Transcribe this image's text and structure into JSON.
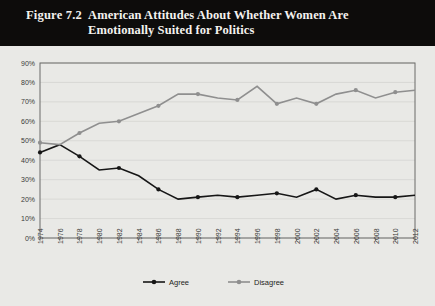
{
  "figure": {
    "number": "Figure 7.2",
    "title": "American Attitudes About Whether Women Are Emotionally Suited for Politics"
  },
  "colors": {
    "banner_background": "#0d0c0b",
    "banner_text": "#f4f2ef",
    "page_background": "#e9e9e6",
    "agree": "#161616",
    "disagree": "#8f8f8f",
    "gridline": "#cfcfcb",
    "axis": "#6b6b68"
  },
  "chart_data": {
    "type": "line",
    "title": "American Attitudes About Whether Women Are Emotionally Suited for Politics",
    "xlabel": "",
    "ylabel": "",
    "xlim": [
      1974,
      2012
    ],
    "ylim": [
      0,
      90
    ],
    "ytick_step": 10,
    "grid": true,
    "legend_position": "bottom",
    "marker_interval_years": 4,
    "x": [
      1974,
      1976,
      1978,
      1980,
      1982,
      1984,
      1986,
      1988,
      1990,
      1992,
      1994,
      1996,
      1998,
      2000,
      2002,
      2004,
      2006,
      2008,
      2010,
      2012
    ],
    "categories": [
      "1974",
      "1976",
      "1978",
      "1980",
      "1982",
      "1984",
      "1986",
      "1988",
      "1990",
      "1992",
      "1994",
      "1996",
      "1998",
      "2000",
      "2002",
      "2004",
      "2006",
      "2008",
      "2010",
      "2012"
    ],
    "ytick_labels": [
      "0%",
      "10%",
      "20%",
      "30%",
      "40%",
      "50%",
      "60%",
      "70%",
      "80%",
      "90%"
    ],
    "ytick_values": [
      0,
      10,
      20,
      30,
      40,
      50,
      60,
      70,
      80,
      90
    ],
    "series": [
      {
        "name": "Agree",
        "color": "#161616",
        "values": [
          44,
          48,
          42,
          35,
          36,
          32,
          25,
          20,
          21,
          22,
          21,
          22,
          23,
          21,
          25,
          20,
          22,
          21,
          21,
          22
        ]
      },
      {
        "name": "Disagree",
        "color": "#8f8f8f",
        "values": [
          49,
          48,
          54,
          59,
          60,
          64,
          68,
          74,
          74,
          72,
          71,
          78,
          69,
          72,
          69,
          74,
          76,
          72,
          75,
          76
        ]
      }
    ]
  },
  "legend": {
    "items": [
      {
        "label": "Agree",
        "color": "#161616"
      },
      {
        "label": "Disagree",
        "color": "#8f8f8f"
      }
    ]
  }
}
